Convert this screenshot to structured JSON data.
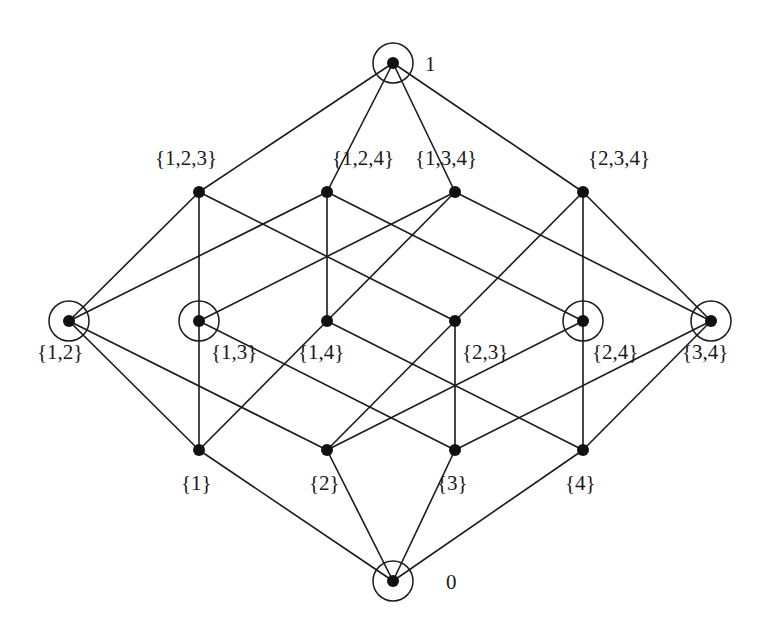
{
  "diagram": {
    "colors": {
      "line": "#1a1a1a",
      "node": "#111111",
      "background": "#ffffff"
    },
    "nodes": [
      {
        "id": "top",
        "label": "1",
        "x": 393,
        "y": 63,
        "circled": true,
        "lx": 425,
        "ly": 71
      },
      {
        "id": "123",
        "label": "{1,2,3}",
        "x": 199,
        "y": 192,
        "circled": false,
        "lx": 155,
        "ly": 165
      },
      {
        "id": "124",
        "label": "{1,2,4}",
        "x": 327,
        "y": 192,
        "circled": false,
        "lx": 332,
        "ly": 165
      },
      {
        "id": "134",
        "label": "{1,3,4}",
        "x": 455,
        "y": 192,
        "circled": false,
        "lx": 415,
        "ly": 165
      },
      {
        "id": "234",
        "label": "{2,3,4}",
        "x": 583,
        "y": 192,
        "circled": false,
        "lx": 588,
        "ly": 165
      },
      {
        "id": "12",
        "label": "{1,2}",
        "x": 69,
        "y": 321,
        "circled": true,
        "lx": 37,
        "ly": 359
      },
      {
        "id": "13",
        "label": "{1,3}",
        "x": 199,
        "y": 321,
        "circled": true,
        "lx": 211,
        "ly": 359
      },
      {
        "id": "14",
        "label": "{1,4}",
        "x": 327,
        "y": 321,
        "circled": false,
        "lx": 298,
        "ly": 359
      },
      {
        "id": "23",
        "label": "{2,3}",
        "x": 455,
        "y": 321,
        "circled": false,
        "lx": 462,
        "ly": 359
      },
      {
        "id": "24",
        "label": "{2,4}",
        "x": 583,
        "y": 321,
        "circled": true,
        "lx": 592,
        "ly": 359
      },
      {
        "id": "34",
        "label": "{3,4}",
        "x": 711,
        "y": 321,
        "circled": true,
        "lx": 682,
        "ly": 359
      },
      {
        "id": "1",
        "label": "{1}",
        "x": 199,
        "y": 450,
        "circled": false,
        "lx": 181,
        "ly": 490
      },
      {
        "id": "2",
        "label": "{2}",
        "x": 327,
        "y": 450,
        "circled": false,
        "lx": 309,
        "ly": 490
      },
      {
        "id": "3",
        "label": "{3}",
        "x": 455,
        "y": 450,
        "circled": false,
        "lx": 437,
        "ly": 490
      },
      {
        "id": "4",
        "label": "{4}",
        "x": 583,
        "y": 450,
        "circled": false,
        "lx": 565,
        "ly": 490
      },
      {
        "id": "bot",
        "label": "0",
        "x": 393,
        "y": 581,
        "circled": true,
        "lx": 446,
        "ly": 589
      }
    ],
    "edges": [
      [
        "top",
        "123"
      ],
      [
        "top",
        "124"
      ],
      [
        "top",
        "134"
      ],
      [
        "top",
        "234"
      ],
      [
        "123",
        "12"
      ],
      [
        "123",
        "13"
      ],
      [
        "123",
        "23"
      ],
      [
        "124",
        "12"
      ],
      [
        "124",
        "14"
      ],
      [
        "124",
        "24"
      ],
      [
        "134",
        "13"
      ],
      [
        "134",
        "14"
      ],
      [
        "134",
        "34"
      ],
      [
        "234",
        "23"
      ],
      [
        "234",
        "24"
      ],
      [
        "234",
        "34"
      ],
      [
        "12",
        "1"
      ],
      [
        "12",
        "2"
      ],
      [
        "13",
        "1"
      ],
      [
        "13",
        "3"
      ],
      [
        "14",
        "1"
      ],
      [
        "14",
        "4"
      ],
      [
        "23",
        "2"
      ],
      [
        "23",
        "3"
      ],
      [
        "24",
        "2"
      ],
      [
        "24",
        "4"
      ],
      [
        "34",
        "3"
      ],
      [
        "34",
        "4"
      ],
      [
        "1",
        "bot"
      ],
      [
        "2",
        "bot"
      ],
      [
        "3",
        "bot"
      ],
      [
        "4",
        "bot"
      ]
    ],
    "node_radius": 6,
    "ring_radius": 20
  }
}
